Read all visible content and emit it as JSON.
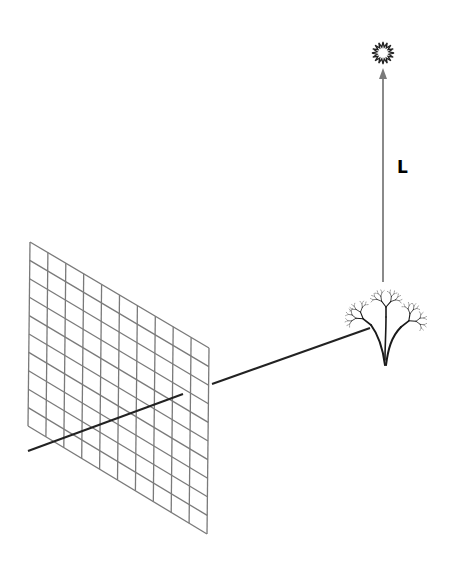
{
  "diagram": {
    "colors": {
      "background": "#ffffff",
      "grid_stroke": "#7a7a7a",
      "ray_stroke": "#222222",
      "arrow_stroke": "#8a8a8a",
      "sun_stroke": "#222222",
      "tree_stroke": "#1a1a1a"
    },
    "grid": {
      "rows": 10,
      "cols": 10,
      "corners": {
        "top_left": [
          30,
          242
        ],
        "top_right": [
          209,
          348
        ],
        "bottom_right": [
          207,
          534
        ],
        "bottom_left": [
          28,
          426
        ]
      }
    },
    "axis_line": {
      "from": [
        28,
        451
      ],
      "to": [
        183,
        394
      ]
    },
    "ray": {
      "from": [
        212,
        384
      ],
      "to": [
        370,
        328
      ]
    },
    "light_vector": {
      "label": "L",
      "label_pos": [
        397,
        157
      ],
      "from": [
        383,
        282
      ],
      "to": [
        383,
        68
      ]
    },
    "sun": {
      "center": [
        383,
        53
      ],
      "r_inner": 6,
      "r_outer": 11,
      "spikes": 16
    },
    "tree": {
      "base": [
        385,
        365
      ],
      "canopy_center": [
        385,
        305
      ]
    }
  }
}
